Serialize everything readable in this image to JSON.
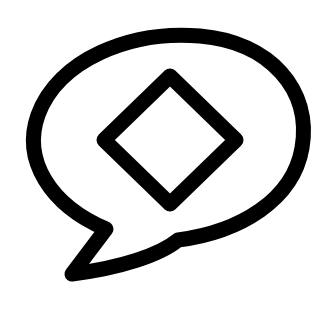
{
  "icon": {
    "name": "speech-bubble-diamond",
    "stroke_color": "#000000",
    "background": "#ffffff"
  }
}
